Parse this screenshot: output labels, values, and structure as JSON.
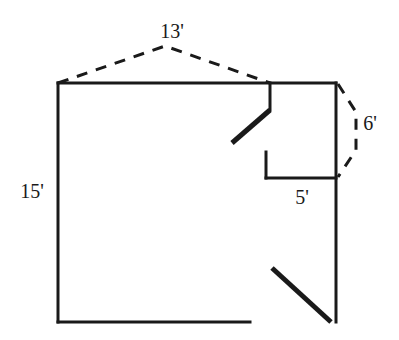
{
  "diagram": {
    "background_color": "#ffffff",
    "line_color": "#1a1a1a",
    "wall_stroke_width": 3,
    "door_stroke_width": 5,
    "dash_stroke_width": 3,
    "dash_pattern": "11,9"
  },
  "labels": {
    "top_width": "13'",
    "left_height": "15'",
    "alcove_width": "5'",
    "right_segment": "6'"
  },
  "label_positions": {
    "top_width": {
      "x": 172,
      "y": 38
    },
    "left_height": {
      "x": 32,
      "y": 198
    },
    "alcove_width": {
      "x": 302,
      "y": 204
    },
    "right_segment": {
      "x": 370,
      "y": 130
    }
  },
  "geometry": {
    "outline_points": "58,83 336,83 336,322 58,322 58,83",
    "walls": [
      {
        "name": "top-wall",
        "x1": 58,
        "y1": 83,
        "x2": 336,
        "y2": 83
      },
      {
        "name": "left-wall",
        "x1": 58,
        "y1": 83,
        "x2": 58,
        "y2": 322
      },
      {
        "name": "bottom-wall",
        "x1": 58,
        "y1": 322,
        "x2": 250,
        "y2": 322
      },
      {
        "name": "right-wall",
        "x1": 336,
        "y1": 83,
        "x2": 336,
        "y2": 322
      },
      {
        "name": "alcove-partition-stub",
        "x1": 270,
        "y1": 83,
        "x2": 270,
        "y2": 110
      },
      {
        "name": "alcove-ledge",
        "x1": 266,
        "y1": 178,
        "x2": 336,
        "y2": 178
      },
      {
        "name": "alcove-ledge-stub",
        "x1": 266,
        "y1": 152,
        "x2": 266,
        "y2": 178
      }
    ],
    "door_swings": [
      {
        "name": "upper-door-swing",
        "x1": 270,
        "y1": 110,
        "x2": 232,
        "y2": 143
      },
      {
        "name": "lower-door-swing",
        "x1": 272,
        "y1": 268,
        "x2": 331,
        "y2": 322
      }
    ],
    "dimension_arcs": [
      {
        "name": "top-width-arc",
        "points": "58,83 165,46 270,83"
      },
      {
        "name": "right-segment-arc",
        "points": "338,84 356,112 356,150 338,177"
      }
    ]
  }
}
